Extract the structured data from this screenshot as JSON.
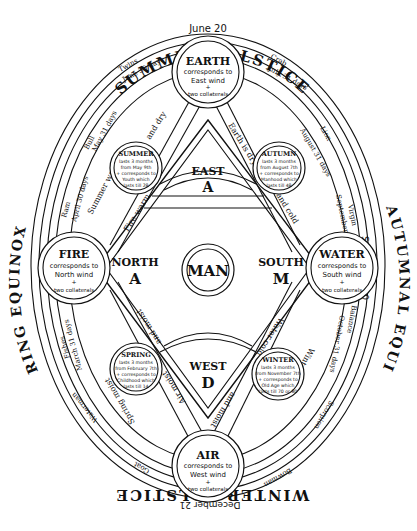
{
  "title_labels": {
    "top": "SUMMER SOLSTICE",
    "top_date": "June 20",
    "left": "SPRING EQUINOX",
    "left_date": "March 21",
    "right": "AUTUMNAL EQUINOX",
    "right_date": "September 20",
    "bottom": "WINTER SOLSTICE",
    "bottom_date": "December 21"
  },
  "elements": {
    "earth": {
      "name": "EARTH",
      "line1": "corresponds to",
      "line2": "East wind",
      "line3": "+",
      "line4": "two collaterals"
    },
    "fire": {
      "name": "FIRE",
      "line1": "corresponds to",
      "line2": "North wind",
      "line3": "+",
      "line4": "two collaterals"
    },
    "water": {
      "name": "WATER",
      "line1": "corresponds to",
      "line2": "South wind",
      "line3": "+",
      "line4": "two collaterals"
    },
    "air": {
      "name": "AIR",
      "line1": "corresponds to",
      "line2": "West wind",
      "line3": "+",
      "line4": "two collaterals"
    }
  },
  "seasons": {
    "summer": {
      "name": "SUMMER",
      "l1": "lasts 3 months",
      "l2": "from May 9th",
      "l3": "+ corresponds to",
      "l4": "Youth which",
      "l5": "lasts till 28"
    },
    "autumn": {
      "name": "AUTUMN",
      "l1": "lasts 3 months",
      "l2": "from August 7th",
      "l3": "+ corresponds to",
      "l4": "Manhood which",
      "l5": "lasts till 48"
    },
    "spring": {
      "name": "SPRING",
      "l1": "lasts 3 months",
      "l2": "from February 7th",
      "l3": "+ corresponds to",
      "l4": "Childhood which",
      "l5": "lasts till 14"
    },
    "winter": {
      "name": "WINTER",
      "l1": "lasts 3 months",
      "l2": "from November 7th",
      "l3": "+ corresponds to",
      "l4": "Old Age which",
      "l5": "lasts till 70 or 80"
    }
  },
  "center": {
    "man": "MAN",
    "east": "EAST",
    "east_letter": "A",
    "north": "NORTH",
    "north_letter": "A",
    "south": "SOUTH",
    "south_letter": "M",
    "west": "WEST",
    "west_letter": "D"
  },
  "qualities": {
    "hot_dry_1": "Summer warm",
    "hot_dry_2": "and dry",
    "earth_dry": "Earth is dry",
    "cold_1": "and cold",
    "fire_warm": "Fire warm",
    "warm_moist": "and moist",
    "air_moist": "Air moist",
    "water_cold": "Water cold",
    "winter_cold": "Winter cold",
    "spring_moist": "Spring moist",
    "and_moist_2": "and moist",
    "autumn_dry": "Autumn is dry"
  },
  "zodiac": {
    "twins": {
      "sign": "Twins",
      "date": "June 30 days",
      "month": "30 minutes"
    },
    "crab": {
      "sign": "Crab",
      "date": "July 31 days",
      "month": "Cancer"
    },
    "bull": {
      "sign": "Bull",
      "date": "May 31 days",
      "month": "30 minutes"
    },
    "lion": {
      "sign": "Lion",
      "date": "August 31 days",
      "month": "Leo"
    },
    "ram": {
      "sign": "Ram",
      "date": "April 30 days",
      "month": "30 minutes"
    },
    "virgin": {
      "sign": "Virgin",
      "date": "September 30 days",
      "month": "Virgo"
    },
    "fishes": {
      "sign": "Fishes",
      "date": "March 31 days",
      "month": "30 minutes"
    },
    "balance": {
      "sign": "Balance",
      "date": "October 31 days",
      "month": "Libra"
    },
    "waterman": {
      "sign": "Waterman",
      "date": "February 28 days",
      "month": "Aquarius"
    },
    "scorpion": {
      "sign": "Scorpion",
      "date": "November 30 days",
      "month": "Scorpio"
    },
    "goat": {
      "sign": "Goat",
      "date": "January 31 days",
      "month": "Capricorn"
    },
    "bowman": {
      "sign": "Bowman",
      "date": "December 31 days",
      "month": "Sagittarius"
    }
  }
}
